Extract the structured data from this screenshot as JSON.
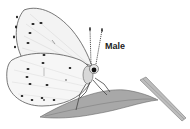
{
  "image": {
    "subject": "butterfly illustration on leaf",
    "label": "Male",
    "colors": {
      "background": "#ffffff",
      "wing_fill": "#f2f2f2",
      "wing_outline": "#555555",
      "spots": "#1a1a1a",
      "leaf": "#9a9a9a"
    }
  }
}
